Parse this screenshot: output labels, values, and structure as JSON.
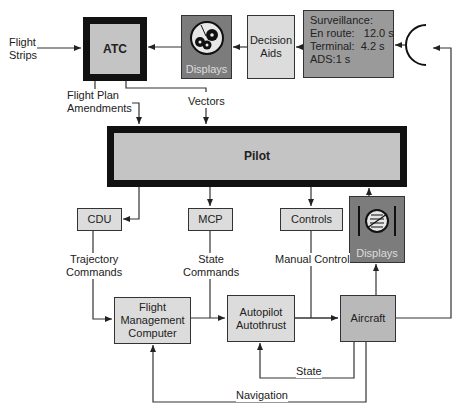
{
  "diagram": {
    "nodes": {
      "atc": {
        "label": "ATC"
      },
      "displays_top": {
        "label": "Displays",
        "icon": "radar-scope-icon"
      },
      "decision_aids": {
        "label": "Decision\nAids",
        "line1": "Decision",
        "line2": "Aids"
      },
      "surveillance": {
        "title": "Surveillance:",
        "rows": [
          {
            "label": "En route:",
            "value": "12.0 s",
            "text": "En route:   12.0 s"
          },
          {
            "label": "Terminal:",
            "value": "4.2 s",
            "text": "Terminal:  4.2 s"
          },
          {
            "label": "ADS:",
            "value": "1 s",
            "text": "ADS:1 s"
          }
        ]
      },
      "radar": {
        "icon": "radar-antenna-icon"
      },
      "pilot": {
        "label": "Pilot"
      },
      "cdu": {
        "label": "CDU"
      },
      "mcp": {
        "label": "MCP"
      },
      "controls": {
        "label": "Controls"
      },
      "displays_cockpit": {
        "label": "Displays",
        "icon": "attitude-indicator-icon"
      },
      "fmc": {
        "line1": "Flight",
        "line2": "Management",
        "line3": "Computer"
      },
      "autopilot": {
        "line1": "Autopilot",
        "line2": "Autothrust"
      },
      "aircraft": {
        "label": "Aircraft"
      }
    },
    "edge_labels": {
      "flight_strips": {
        "line1": "Flight",
        "line2": "Strips"
      },
      "flight_plan_amendments": {
        "line1": "Flight Plan",
        "line2": "Amendments"
      },
      "vectors": "Vectors",
      "trajectory_commands": {
        "line1": "Trajectory",
        "line2": "Commands"
      },
      "state_commands": {
        "line1": "State",
        "line2": "Commands"
      },
      "manual_control": "Manual Control",
      "state": "State",
      "navigation": "Navigation"
    },
    "colors": {
      "thick_border": "#111111",
      "thick_fill": "#c4c4c4",
      "display_fill": "#7c7c7c",
      "surveillance_fill": "#9a9a9a",
      "light_fill": "#dcdcdc",
      "aircraft_fill": "#b9b9b9",
      "line": "#333333"
    }
  }
}
